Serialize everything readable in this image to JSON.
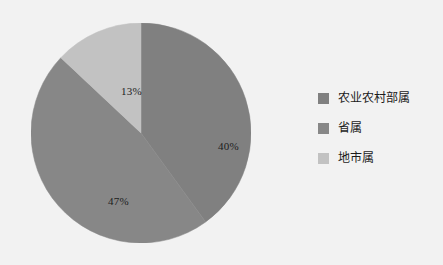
{
  "background_color": "#f2f2f2",
  "chart_data": {
    "type": "pie",
    "title": "",
    "subtitle": "",
    "xlabel": "",
    "ylabel": "",
    "categories": [
      "农业农村部属",
      "省属",
      "地市属"
    ],
    "values": [
      40,
      47,
      13
    ],
    "value_unit": "%",
    "data_labels": [
      "40%",
      "47%",
      "13%"
    ],
    "colors": [
      "#808080",
      "#878787",
      "#c2c2c2"
    ],
    "start_angle_deg": 0,
    "direction": "clockwise",
    "legend_position": "right",
    "grid": false,
    "slices": [
      {
        "label": "农业农村部属",
        "value": 40,
        "data_label": "40%",
        "color": "#808080",
        "start_angle_deg": 0,
        "end_angle_deg": 144
      },
      {
        "label": "省属",
        "value": 47,
        "data_label": "47%",
        "color": "#878787",
        "start_angle_deg": 144,
        "end_angle_deg": 313.2
      },
      {
        "label": "地市属",
        "value": 13,
        "data_label": "13%",
        "color": "#c2c2c2",
        "start_angle_deg": 313.2,
        "end_angle_deg": 360
      }
    ]
  },
  "legend": {
    "items": [
      {
        "label": "农业农村部属",
        "color": "#808080"
      },
      {
        "label": "省属",
        "color": "#878787"
      },
      {
        "label": "地市属",
        "color": "#c2c2c2"
      }
    ]
  }
}
